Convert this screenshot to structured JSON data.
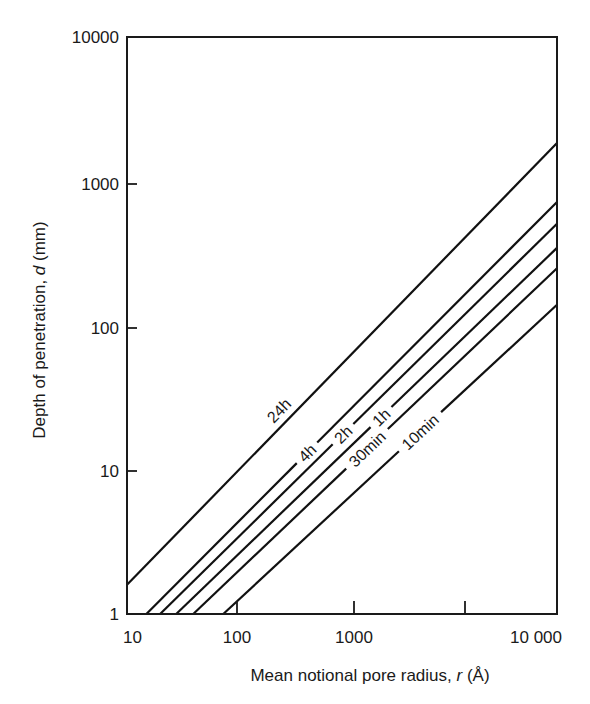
{
  "chart_data": {
    "type": "line",
    "title": "",
    "xlabel": "Mean notional pore radius, r (Å)",
    "xlabel_parts": {
      "pre": "Mean notional pore radius, ",
      "var": "r",
      "post": " (Å)"
    },
    "ylabel": "Depth of penetration, d (mm)",
    "ylabel_parts": {
      "pre": "Depth of penetration, ",
      "var": "d",
      "post": " (mm)"
    },
    "x_scale": "log",
    "y_scale": "log",
    "xlim": [
      10,
      16000
    ],
    "ylim": [
      1,
      10000
    ],
    "x_ticks": [
      {
        "value": 10,
        "label": "10"
      },
      {
        "value": 100,
        "label": "100"
      },
      {
        "value": 1000,
        "label": "1000"
      },
      {
        "value": 10000,
        "label": "10 000"
      }
    ],
    "y_ticks": [
      {
        "value": 1,
        "label": "1"
      },
      {
        "value": 10,
        "label": "10"
      },
      {
        "value": 100,
        "label": "100"
      },
      {
        "value": 1000,
        "label": "1000"
      },
      {
        "value": 10000,
        "label": "10000"
      }
    ],
    "grid": false,
    "legend": "inline labels on lines",
    "series": [
      {
        "name": "24h",
        "points": [
          [
            10,
            1.6
          ],
          [
            16000,
            1900
          ]
        ]
      },
      {
        "name": "4h",
        "points": [
          [
            15,
            1
          ],
          [
            16000,
            750
          ]
        ]
      },
      {
        "name": "2h",
        "points": [
          [
            20,
            1
          ],
          [
            16000,
            530
          ]
        ]
      },
      {
        "name": "1h",
        "points": [
          [
            28,
            1
          ],
          [
            16000,
            360
          ]
        ]
      },
      {
        "name": "30min",
        "points": [
          [
            40,
            1
          ],
          [
            16000,
            260
          ]
        ]
      },
      {
        "name": "10min",
        "points": [
          [
            75,
            1
          ],
          [
            16000,
            145
          ]
        ]
      }
    ]
  }
}
